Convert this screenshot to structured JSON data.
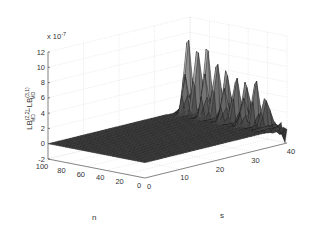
{
  "chart_data": {
    "type": "surface",
    "title": "",
    "xlabel": "s",
    "ylabel": "n",
    "zlabel": "LB(2,2)MD - LB(3,1)MD",
    "zlabel_parts": {
      "main1": "LB",
      "sup1": "(2,2)",
      "sub1": "MD",
      "minus": "−",
      "main2": "LB",
      "sup2": "(3,1)",
      "sub2": "MD"
    },
    "z_exponent_label": "x 10",
    "z_exponent": "-7",
    "xlim": [
      0,
      40
    ],
    "ylim": [
      0,
      100
    ],
    "zlim": [
      -2,
      12
    ],
    "xticks": [
      0,
      10,
      20,
      30,
      40
    ],
    "yticks": [
      0,
      20,
      40,
      60,
      80,
      100
    ],
    "zticks": [
      -2,
      0,
      2,
      4,
      6,
      8,
      10,
      12
    ],
    "xtick_labels": [
      "0",
      "10",
      "20",
      "30",
      "40"
    ],
    "ytick_labels": [
      "0",
      "20",
      "40",
      "60",
      "80",
      "100"
    ],
    "ztick_labels": [
      "-2",
      "0",
      "2",
      "4",
      "6",
      "8",
      "10",
      "12"
    ],
    "grid": true,
    "colormap": "gray",
    "peaks": [
      {
        "s": 38,
        "n": 95,
        "z": 11.5
      },
      {
        "s": 38,
        "n": 85,
        "z": 9.5
      },
      {
        "s": 38,
        "n": 75,
        "z": 10.8
      },
      {
        "s": 38,
        "n": 65,
        "z": 8.0
      },
      {
        "s": 38,
        "n": 55,
        "z": 7.5
      },
      {
        "s": 38,
        "n": 45,
        "z": 6.5
      },
      {
        "s": 38,
        "n": 35,
        "z": 6.0
      },
      {
        "s": 38,
        "n": 25,
        "z": 7.0
      },
      {
        "s": 38,
        "n": 15,
        "z": 4.0
      },
      {
        "s": 36,
        "n": 90,
        "z": 5.0
      },
      {
        "s": 36,
        "n": 70,
        "z": 6.0
      },
      {
        "s": 36,
        "n": 50,
        "z": 4.5
      },
      {
        "s": 36,
        "n": 30,
        "z": 3.5
      },
      {
        "s": 40,
        "n": 2,
        "z": -1.5
      }
    ]
  }
}
